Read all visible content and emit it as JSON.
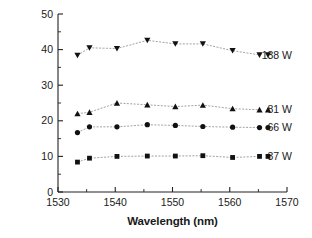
{
  "chart_data": {
    "type": "line",
    "title": "",
    "xlabel": "Wavelength (nm)",
    "ylabel": "Signal power (W)",
    "xlim": [
      1530,
      1570
    ],
    "ylim": [
      0,
      50
    ],
    "xticks": [
      1530,
      1540,
      1550,
      1560,
      1570
    ],
    "yticks": [
      0,
      10,
      20,
      30,
      40,
      50
    ],
    "xtick_labels": [
      "1530",
      "1540",
      "1550",
      "1560",
      "1570"
    ],
    "ytick_labels": [
      "0",
      "10",
      "20",
      "30",
      "40",
      "50"
    ],
    "x_minor_ticks": [
      1535,
      1545,
      1555,
      1565
    ],
    "y_minor_ticks": [
      5,
      15,
      25,
      35,
      45
    ],
    "grid": false,
    "legend_position": "right-inline",
    "x": [
      1533.4,
      1535.5,
      1540.3,
      1545.6,
      1550.5,
      1555.3,
      1560.5,
      1565.2
    ],
    "series": [
      {
        "name": "138 W",
        "label": "138 W",
        "marker": "triangle-down",
        "color": "#111111",
        "values": [
          38.4,
          40.5,
          40.3,
          42.6,
          41.6,
          41.6,
          39.7,
          38.5
        ]
      },
      {
        "name": "81 W",
        "label": "81 W",
        "marker": "triangle-up",
        "color": "#111111",
        "values": [
          22.0,
          22.4,
          25.0,
          24.5,
          24.0,
          24.4,
          23.4,
          23.1
        ]
      },
      {
        "name": "66 W",
        "label": "66 W",
        "marker": "circle",
        "color": "#111111",
        "values": [
          16.7,
          18.3,
          18.3,
          18.9,
          18.7,
          18.4,
          18.2,
          18.1
        ]
      },
      {
        "name": "37 W",
        "label": "37 W",
        "marker": "square",
        "color": "#111111",
        "values": [
          8.4,
          9.5,
          10.0,
          10.1,
          10.1,
          10.2,
          9.7,
          10.0
        ]
      }
    ]
  },
  "axes": {
    "x_axis_name": "wavelength-axis",
    "y_axis_name": "signal-power-axis"
  }
}
